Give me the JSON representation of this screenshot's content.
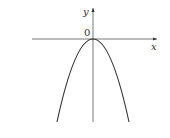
{
  "diagram": {
    "type": "function-graph",
    "labels": {
      "y_axis": "y",
      "x_axis": "x",
      "origin": "0"
    },
    "colors": {
      "stroke": "#333333",
      "background": "#ffffff"
    }
  }
}
